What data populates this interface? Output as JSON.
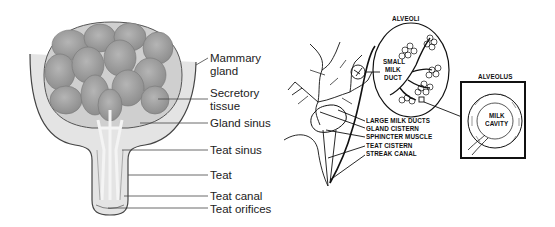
{
  "left_diagram": {
    "labels": {
      "mammary_gland_1": "Mammary",
      "mammary_gland_2": "gland",
      "secretory_tissue_1": "Secretory",
      "secretory_tissue_2": "tissue",
      "gland_sinus": "Gland sinus",
      "teat_sinus": "Teat sinus",
      "teat": "Teat",
      "teat_canal": "Teat canal",
      "teat_orifices": "Teat orifices"
    }
  },
  "right_diagram": {
    "titles": {
      "alveoli": "ALVEOLI",
      "alveolus": "ALVEOLUS"
    },
    "labels": {
      "small_milk_duct_1": "SMALL",
      "small_milk_duct_2": "MILK",
      "small_milk_duct_3": "DUCT",
      "milk_cavity_1": "MILK",
      "milk_cavity_2": "CAVITY",
      "large_milk_ducts": "LARGE MILK DUCTS",
      "gland_cistern": "GLAND CISTERN",
      "sphincter_muscle": "SPHINCTER MUSCLE",
      "teat_cistern": "TEAT CISTERN",
      "streak_canal": "STREAK CANAL"
    }
  }
}
